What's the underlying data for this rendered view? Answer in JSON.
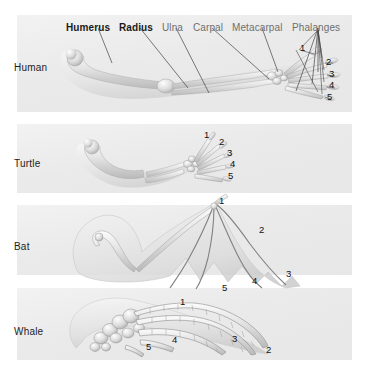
{
  "figure": {
    "title_visible": false,
    "background_color": "#ffffff",
    "panel_color": "#ececec",
    "label_color": "#6f6f6f",
    "emphasis_label_color": "#1a1a1a",
    "digit_number_color": "#111111"
  },
  "bone_labels": [
    {
      "text": "Humerus",
      "emphasis": true,
      "x": 66,
      "y": 22
    },
    {
      "text": "Radius",
      "emphasis": true,
      "x": 119,
      "y": 22
    },
    {
      "text": "Ulna",
      "emphasis": false,
      "x": 162,
      "y": 22
    },
    {
      "text": "Carpal",
      "emphasis": false,
      "x": 193,
      "y": 22
    },
    {
      "text": "Metacarpal",
      "emphasis": false,
      "x": 232,
      "y": 22
    },
    {
      "text": "Phalanges",
      "emphasis": false,
      "x": 292,
      "y": 22
    }
  ],
  "panels": [
    {
      "name": "Human",
      "label": "Human",
      "label_x": 14,
      "label_y": 62,
      "rect": {
        "x": 17,
        "y": 15,
        "w": 335,
        "h": 97
      },
      "digits": [
        {
          "text": "1",
          "x": 300,
          "y": 43
        },
        {
          "text": "2",
          "x": 326,
          "y": 57
        },
        {
          "text": "3",
          "x": 329,
          "y": 69
        },
        {
          "text": "4",
          "x": 329,
          "y": 80
        },
        {
          "text": "5",
          "x": 327,
          "y": 92
        }
      ]
    },
    {
      "name": "Turtle",
      "label": "Turtle",
      "label_x": 14,
      "label_y": 158,
      "rect": {
        "x": 17,
        "y": 124,
        "w": 335,
        "h": 69
      },
      "digits": [
        {
          "text": "1",
          "x": 204,
          "y": 130
        },
        {
          "text": "2",
          "x": 219,
          "y": 137
        },
        {
          "text": "3",
          "x": 227,
          "y": 148
        },
        {
          "text": "4",
          "x": 230,
          "y": 159
        },
        {
          "text": "5",
          "x": 228,
          "y": 171
        }
      ]
    },
    {
      "name": "Bat",
      "label": "Bat",
      "label_x": 14,
      "label_y": 241,
      "rect": {
        "x": 17,
        "y": 205,
        "w": 335,
        "h": 70
      },
      "digits": [
        {
          "text": "1",
          "x": 219,
          "y": 196
        },
        {
          "text": "2",
          "x": 259,
          "y": 225
        },
        {
          "text": "3",
          "x": 286,
          "y": 269
        },
        {
          "text": "4",
          "x": 252,
          "y": 276
        },
        {
          "text": "5",
          "x": 222,
          "y": 283
        }
      ]
    },
    {
      "name": "Whale",
      "label": "Whale",
      "label_x": 14,
      "label_y": 326,
      "rect": {
        "x": 17,
        "y": 288,
        "w": 335,
        "h": 72
      },
      "digits": [
        {
          "text": "1",
          "x": 180,
          "y": 297
        },
        {
          "text": "2",
          "x": 266,
          "y": 345
        },
        {
          "text": "3",
          "x": 232,
          "y": 334
        },
        {
          "text": "4",
          "x": 172,
          "y": 335
        },
        {
          "text": "5",
          "x": 146,
          "y": 342
        }
      ]
    }
  ],
  "leader_lines": [
    {
      "from_label": "Humerus",
      "x1": 98,
      "y1": 28,
      "x2": 112,
      "y2": 63
    },
    {
      "from_label": "Radius",
      "x1": 140,
      "y1": 28,
      "x2": 188,
      "y2": 88
    },
    {
      "from_label": "Ulna",
      "x1": 176,
      "y1": 28,
      "x2": 209,
      "y2": 93
    },
    {
      "from_label": "Carpal",
      "x1": 212,
      "y1": 28,
      "x2": 269,
      "y2": 79
    },
    {
      "from_label": "Metacarpal",
      "x1": 262,
      "y1": 28,
      "x2": 278,
      "y2": 72
    },
    {
      "from_label": "Phalanges",
      "x1": 318,
      "y1": 28,
      "x2": 296,
      "y2": 91
    },
    {
      "from_label": "Phalanges",
      "x1": 318,
      "y1": 28,
      "x2": 312,
      "y2": 84
    },
    {
      "from_label": "Phalanges",
      "x1": 318,
      "y1": 28,
      "x2": 318,
      "y2": 72
    }
  ]
}
